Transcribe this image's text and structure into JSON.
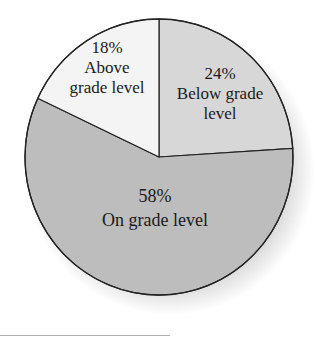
{
  "chart_data": {
    "type": "pie",
    "title": "",
    "slices": [
      {
        "label": "Below grade level",
        "value": 24,
        "percent_label": "24%",
        "color": "#d7d7d7"
      },
      {
        "label": "On grade level",
        "value": 58,
        "percent_label": "58%",
        "color": "#bdbdbd"
      },
      {
        "label": "Above grade level",
        "value": 18,
        "percent_label": "18%",
        "color": "#f4f4f4"
      }
    ],
    "legend": "none",
    "labels_inside": true
  },
  "labels": {
    "above": {
      "pct": "18%",
      "line1": "Above",
      "line2": "grade level"
    },
    "below": {
      "pct": "24%",
      "line1": "Below grade",
      "line2": "level"
    },
    "on": {
      "pct": "58%",
      "line1": "On grade level"
    }
  }
}
